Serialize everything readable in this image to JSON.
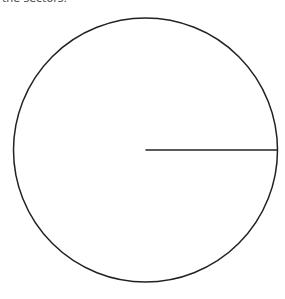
{
  "caption": {
    "text": "the sectors."
  },
  "diagram": {
    "type": "circle-with-radius",
    "circle": {
      "cx": 145.5,
      "cy": 150,
      "r": 132,
      "stroke": "#222222",
      "stroke_width": 1.5,
      "fill": "none"
    },
    "radius_line": {
      "x1": 145.5,
      "y1": 150,
      "x2": 277.5,
      "y2": 150,
      "stroke": "#222222",
      "stroke_width": 1.3
    }
  }
}
